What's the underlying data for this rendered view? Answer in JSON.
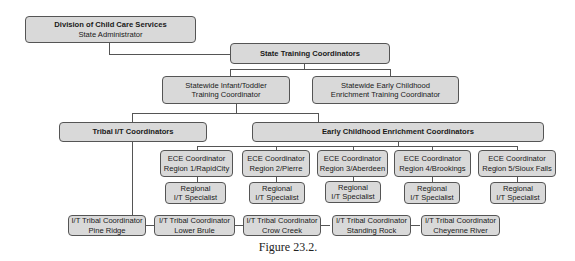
{
  "boxes": {
    "division": {
      "line1": "Division of Child Care Services",
      "line2": "State Administrator"
    },
    "state_training": {
      "label": "State Training Coordinators"
    },
    "infant_toddler": {
      "line1": "Statewide Infant/Toddler",
      "line2": "Training Coordinator"
    },
    "early_childhood": {
      "line1": "Statewide Early Childhood",
      "line2": "Enrichment Training Coordinator"
    },
    "tribal_it": {
      "label": "Tribal I/T Coordinators"
    },
    "ece_coordinators": {
      "label": "Early Childhood Enrichment Coordinators"
    },
    "ece_regions": [
      {
        "line1": "ECE Coordinator",
        "line2": "Region 1/RapidCity"
      },
      {
        "line1": "ECE Coordinator",
        "line2": "Region 2/Pierre"
      },
      {
        "line1": "ECE Coordinator",
        "line2": "Region 3/Aberdeen"
      },
      {
        "line1": "ECE Coordinator",
        "line2": "Region 4/Brookings"
      },
      {
        "line1": "ECE Coordinator",
        "line2": "Region 5/Sioux Falls"
      }
    ],
    "it_specialists": [
      {
        "line1": "Regional",
        "line2": "I/T Specialist"
      },
      {
        "line1": "Regional",
        "line2": "I/T Specialist"
      },
      {
        "line1": "Regional",
        "line2": "I/T Specialist"
      },
      {
        "line1": "Regional",
        "line2": "I/T Specialist"
      },
      {
        "line1": "Regional",
        "line2": "I/T Specialist"
      }
    ],
    "tribal_coordinators": [
      {
        "line1": "I/T Tribal Coordinator",
        "line2": "Pine Ridge"
      },
      {
        "line1": "I/T Tribal Coordinator",
        "line2": "Lower Brule"
      },
      {
        "line1": "I/T Tribal Coordinator",
        "line2": "Crow Creek"
      },
      {
        "line1": "I/T Tribal Coordinator",
        "line2": "Standing Rock"
      },
      {
        "line1": "I/T Tribal Coordinator",
        "line2": "Cheyenne River"
      }
    ]
  },
  "caption": "Figure 23.2.",
  "colors": {
    "box_fill": "#d9d9d9",
    "box_border": "#555555",
    "line": "#555555"
  }
}
